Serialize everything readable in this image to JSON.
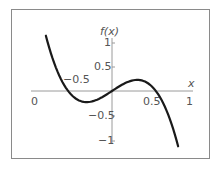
{
  "chart_data": {
    "type": "line",
    "title": "",
    "xlabel": "x",
    "ylabel": "f(x)",
    "function": "f(x) = x - 3x^3",
    "x_tick_labels": [
      {
        "label": "0",
        "x": -1,
        "note": "printed label at x=-1 position"
      },
      {
        "label": "-0.5",
        "x": -0.5,
        "position": "above axis"
      },
      {
        "label": "0.5",
        "x": 0.5
      },
      {
        "label": "1",
        "x": 1
      }
    ],
    "y_tick_labels": [
      {
        "label": "1",
        "y": 1
      },
      {
        "label": "0.5",
        "y": 0.5
      },
      {
        "label": "-0.5",
        "y": -0.5
      },
      {
        "label": "-1",
        "y": -1
      }
    ],
    "xlim": [
      -1.05,
      1.05
    ],
    "ylim": [
      -1.0,
      1.0
    ],
    "grid": false,
    "legend": "none",
    "series": [
      {
        "name": "f(x)",
        "x": [
          -0.87,
          -0.8,
          -0.7,
          -0.6,
          -0.577,
          -0.5,
          -0.4,
          -0.333,
          -0.3,
          -0.2,
          -0.1,
          0,
          0.1,
          0.2,
          0.3,
          0.333,
          0.4,
          0.5,
          0.577,
          0.6,
          0.7,
          0.8,
          0.87
        ],
        "y": [
          1.11,
          0.74,
          0.33,
          0.05,
          0.0,
          -0.13,
          -0.21,
          -0.22,
          -0.22,
          -0.18,
          -0.1,
          0,
          0.1,
          0.18,
          0.22,
          0.22,
          0.21,
          0.13,
          0.0,
          -0.05,
          -0.33,
          -0.74,
          -1.11
        ]
      }
    ],
    "features": {
      "roots": [
        -0.577,
        0,
        0.577
      ],
      "local_max": [
        0.333,
        0.222
      ],
      "local_min": [
        -0.333,
        -0.222
      ]
    }
  },
  "labels": {
    "x_axis": "x",
    "y_axis": "f(x)",
    "x_ticks": [
      "0",
      "−0.5",
      "0.5",
      "1"
    ],
    "y_ticks": [
      "1",
      "0.5",
      "−0.5",
      "−1"
    ]
  },
  "colors": {
    "curve": "#1a1a1a",
    "axes": "#9a9a9a",
    "frame": "#8a8a8a",
    "text": "#555555"
  }
}
